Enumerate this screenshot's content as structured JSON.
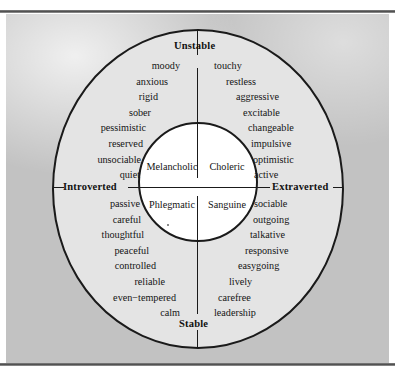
{
  "figure": {
    "axes": {
      "top_label": "Unstable",
      "bottom_label": "Stable",
      "left_label": "Introverted",
      "right_label": "Extraverted"
    },
    "temperaments": {
      "melancholic": "Melancholic",
      "choleric": "Choleric",
      "phlegmatic": "Phlegmatic",
      "sanguine": "Sanguine"
    },
    "quadrants": {
      "unstable_introverted": {
        "temperament": "Melancholic",
        "traits": [
          "moody",
          "anxious",
          "rigid",
          "sober",
          "pessimistic",
          "reserved",
          "unsociable",
          "quiet"
        ]
      },
      "unstable_extraverted": {
        "temperament": "Choleric",
        "traits": [
          "touchy",
          "restless",
          "aggressive",
          "excitable",
          "changeable",
          "impulsive",
          "optimistic",
          "active"
        ]
      },
      "stable_introverted": {
        "temperament": "Phlegmatic",
        "traits": [
          "passive",
          "careful",
          "thoughtful",
          "peaceful",
          "controlled",
          "reliable",
          "even−tempered",
          "calm"
        ]
      },
      "stable_extraverted": {
        "temperament": "Sanguine",
        "traits": [
          "sociable",
          "outgoing",
          "talkative",
          "responsive",
          "easygoing",
          "lively",
          "carefree",
          "leadership"
        ]
      }
    },
    "colors": {
      "outer_background": "#c2c2c2",
      "ellipse_fill": "#e4e4e4",
      "inner_circle_fill": "#ffffff",
      "stroke": "#1a1a1a",
      "text": "#141414"
    }
  }
}
